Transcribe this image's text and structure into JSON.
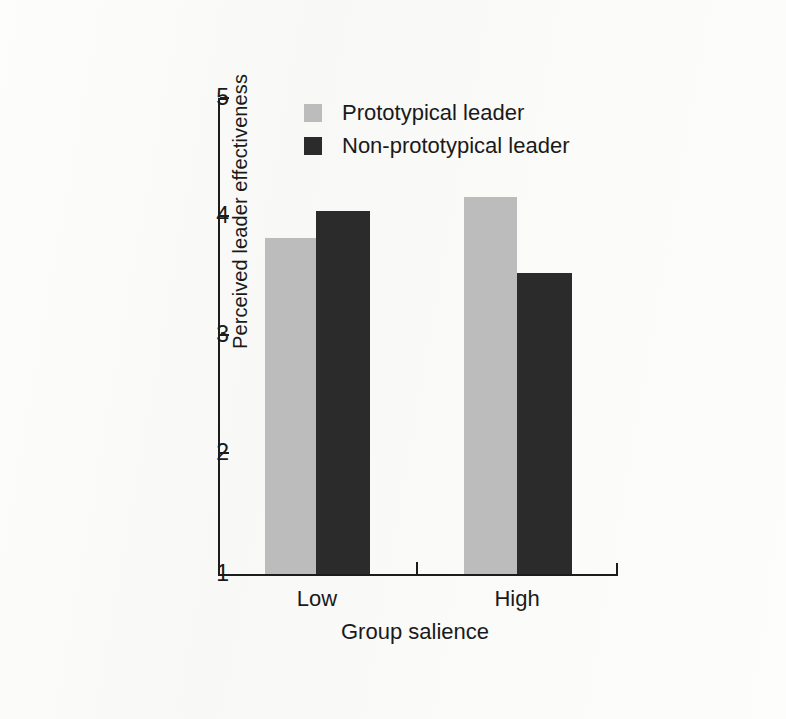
{
  "chart_data": {
    "type": "bar",
    "title": "",
    "xlabel": "Group salience",
    "ylabel": "Perceived leader effectiveness",
    "categories": [
      "Low",
      "High"
    ],
    "ylim": [
      1,
      5
    ],
    "yticks": [
      1,
      2,
      3,
      4,
      5
    ],
    "ytick_labels": [
      "1",
      "2",
      "3",
      "4",
      "5"
    ],
    "grid": false,
    "legend_position": "top-center",
    "series": [
      {
        "name": "Prototypical leader",
        "color": "#bcbcbc",
        "values": [
          3.82,
          4.17
        ]
      },
      {
        "name": "Non-prototypical leader",
        "color": "#2b2b2b",
        "values": [
          4.05,
          3.53
        ]
      }
    ]
  },
  "axis": {
    "y_tick_1": "1",
    "y_tick_2": "2",
    "y_tick_3": "3",
    "y_tick_4": "4",
    "y_tick_5": "5",
    "y_title": "Perceived leader effectiveness",
    "x_title": "Group salience",
    "x_cat_low": "Low",
    "x_cat_high": "High"
  },
  "legend": {
    "items": [
      {
        "label": "Prototypical leader",
        "color": "#bcbcbc"
      },
      {
        "label": "Non-prototypical leader",
        "color": "#2b2b2b"
      }
    ]
  },
  "colors": {
    "light_bar": "#bcbcbc",
    "dark_bar": "#2b2b2b",
    "axis": "#1c1c1c",
    "background": "#fdfdfc"
  }
}
